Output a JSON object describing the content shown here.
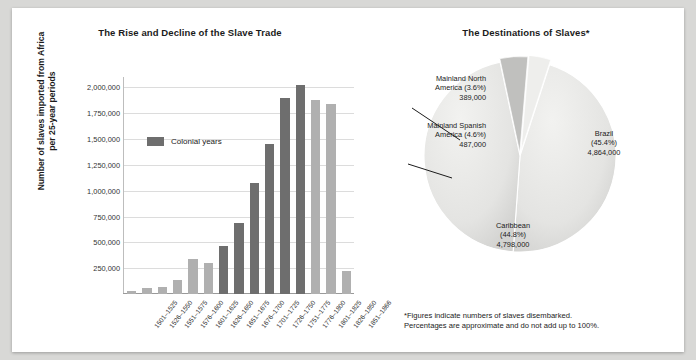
{
  "figure": {
    "background": "#d8d8d6",
    "card_background": "#ffffff"
  },
  "bar_panel": {
    "title": "The Rise and Decline of the Slave Trade",
    "ylabel_line1": "Number of slaves imported from Africa",
    "ylabel_line2": "per 25-year periods",
    "legend_label": "Colonial years",
    "legend_color": "#6e6e6e",
    "other_color": "#b0b0b0"
  },
  "pie_panel": {
    "title": "The Destinations of Slaves*",
    "footnote_line1": "*Figures indicate numbers of slaves disembarked.",
    "footnote_line2": "Percentages are approximate and do not add up to 100%.",
    "callouts": [
      {
        "name_line1": "Mainland North",
        "name_line2": "America (3.6%)",
        "value": "389,000"
      },
      {
        "name_line1": "Mainland Spanish",
        "name_line2": "America (4.6%)",
        "value": "487,000"
      }
    ],
    "inlabels": [
      {
        "name": "Brazil",
        "pct": "(45.4%)",
        "value": "4,864,000"
      },
      {
        "name": "Caribbean",
        "pct": "(44.8%)",
        "value": "4,798,000"
      }
    ]
  },
  "chart_data": [
    {
      "type": "bar",
      "title": "The Rise and Decline of the Slave Trade",
      "xlabel": "",
      "ylabel": "Number of slaves imported from Africa per 25-year periods",
      "ylim": [
        0,
        2100000
      ],
      "yticks": [
        250000,
        500000,
        750000,
        1000000,
        1250000,
        1500000,
        1750000,
        2000000
      ],
      "ytick_labels": [
        "250,000",
        "500,000",
        "750,000",
        "1,000,000",
        "1,250,000",
        "1,500,000",
        "1,750,000",
        "2,000,000"
      ],
      "grid": true,
      "legend": {
        "position": "inside-left",
        "entries": [
          "Colonial years"
        ]
      },
      "categories": [
        "1501–1525",
        "1526–1550",
        "1551–1575",
        "1576–1600",
        "1601–1625",
        "1626–1650",
        "1651–1675",
        "1676–1700",
        "1701–1725",
        "1726–1750",
        "1751–1775",
        "1776–1800",
        "1801–1825",
        "1826–1850",
        "1851–1866"
      ],
      "values": [
        33000,
        62000,
        65000,
        140000,
        335000,
        300000,
        465000,
        690000,
        1075000,
        1450000,
        1900000,
        2020000,
        1880000,
        1840000,
        225000
      ],
      "colonial_years": [
        false,
        false,
        false,
        false,
        false,
        false,
        true,
        true,
        true,
        true,
        true,
        true,
        false,
        false,
        false
      ]
    },
    {
      "type": "pie",
      "title": "The Destinations of Slaves*",
      "labels": [
        "Brazil",
        "Caribbean",
        "Mainland Spanish America",
        "Mainland North America"
      ],
      "percents": [
        45.4,
        44.8,
        4.6,
        3.6
      ],
      "values": [
        4864000,
        4798000,
        487000,
        389000
      ],
      "value_labels": [
        "4,864,000",
        "4,798,000",
        "487,000",
        "389,000"
      ],
      "pct_labels": [
        "(45.4%)",
        "(44.8%)",
        "(4.6%)",
        "(3.6%)"
      ],
      "colors": [
        "#e3e3e1",
        "#dededc",
        "#c0c0be",
        "#eeeeec"
      ],
      "legend": {
        "position": "callout-and-inline"
      }
    }
  ]
}
